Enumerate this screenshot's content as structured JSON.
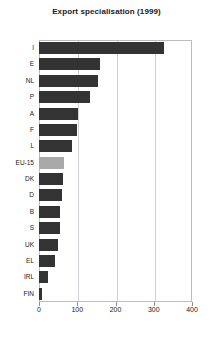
{
  "chart_data": {
    "type": "bar",
    "orientation": "horizontal",
    "title": "Export specialisation (1999)",
    "xlabel": "",
    "ylabel": "",
    "categories": [
      "I",
      "E",
      "NL",
      "P",
      "A",
      "F",
      "L",
      "EU-15",
      "DK",
      "D",
      "B",
      "S",
      "UK",
      "EL",
      "IRL",
      "FIN"
    ],
    "values": [
      326,
      159,
      154,
      133,
      102,
      99,
      86,
      65,
      63,
      60,
      55,
      54,
      50,
      42,
      24,
      8
    ],
    "xlim": [
      0,
      400
    ],
    "xticks": [
      0,
      100,
      200,
      300,
      400
    ],
    "xtick_labels": [
      "0",
      "100",
      "200",
      "300",
      "400"
    ],
    "grid": "vertical",
    "legend": "none",
    "highlight_category": "EU-15",
    "colors": {
      "bar": "#333333",
      "highlight_bar": "#a8a8a8",
      "frame": "#b9bcc2",
      "gridline": "#cfd2d6",
      "text": "#1a1a1a",
      "background": "#ffffff"
    }
  }
}
